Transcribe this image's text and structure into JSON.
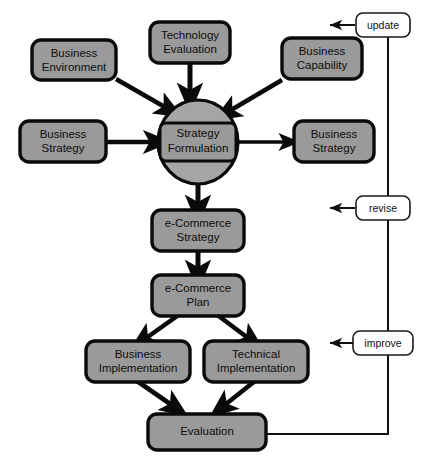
{
  "diagram": {
    "type": "flowchart",
    "colors": {
      "node_fill": "#9a9a9a",
      "node_stroke": "#0a0a0a",
      "ellipse_fill": "#a5a5a5",
      "loop_fill": "#ffffff",
      "loop_stroke": "#1a1a1a",
      "arrow": "#0a0a0a",
      "background": "#ffffff"
    },
    "nodes": {
      "business_environment": {
        "line1": "Business",
        "line2": "Environment"
      },
      "technology_evaluation": {
        "line1": "Technology",
        "line2": "Evaluation"
      },
      "business_capability": {
        "line1": "Business",
        "line2": "Capability"
      },
      "business_strategy_left": {
        "line1": "Business",
        "line2": "Strategy"
      },
      "business_strategy_right": {
        "line1": "Business",
        "line2": "Strategy"
      },
      "strategy_formulation": {
        "line1": "Strategy",
        "line2": "Formulation"
      },
      "ecommerce_strategy": {
        "line1": "e-Commerce",
        "line2": "Strategy"
      },
      "ecommerce_plan": {
        "line1": "e-Commerce",
        "line2": "Plan"
      },
      "business_implementation": {
        "line1": "Business",
        "line2": "Implementation"
      },
      "technical_implementation": {
        "line1": "Technical",
        "line2": "Implementation"
      },
      "evaluation": {
        "line1": "Evaluation",
        "line2": ""
      }
    },
    "feedback_labels": {
      "update": "update",
      "revise": "revise",
      "improve": "improve"
    },
    "edges": [
      {
        "from": "business_environment",
        "to": "strategy_formulation",
        "style": "thick-arrow"
      },
      {
        "from": "technology_evaluation",
        "to": "strategy_formulation",
        "style": "thick-arrow"
      },
      {
        "from": "business_capability",
        "to": "strategy_formulation",
        "style": "thick-arrow"
      },
      {
        "from": "business_strategy_left",
        "to": "strategy_formulation",
        "style": "thick-arrow"
      },
      {
        "from": "strategy_formulation",
        "to": "business_strategy_right",
        "style": "thick-arrow"
      },
      {
        "from": "strategy_formulation",
        "to": "ecommerce_strategy",
        "style": "thick-arrow"
      },
      {
        "from": "ecommerce_strategy",
        "to": "ecommerce_plan",
        "style": "thick-arrow"
      },
      {
        "from": "ecommerce_plan",
        "to": "business_implementation",
        "style": "thick-arrow"
      },
      {
        "from": "ecommerce_plan",
        "to": "technical_implementation",
        "style": "thick-arrow"
      },
      {
        "from": "business_implementation",
        "to": "evaluation",
        "style": "thick-arrow"
      },
      {
        "from": "technical_implementation",
        "to": "evaluation",
        "style": "thick-arrow"
      },
      {
        "from": "evaluation",
        "to": "update",
        "style": "feedback-line"
      },
      {
        "from": "evaluation",
        "to": "revise",
        "style": "feedback-line"
      },
      {
        "from": "evaluation",
        "to": "improve",
        "style": "feedback-line"
      }
    ]
  }
}
